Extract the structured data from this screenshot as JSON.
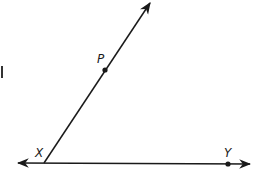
{
  "diagram": {
    "type": "geometry-angle",
    "colors": {
      "stroke": "#1a1a1a",
      "background": "#ffffff"
    },
    "points": [
      {
        "id": "X",
        "label": "X",
        "x": 44,
        "y": 163,
        "dot": false
      },
      {
        "id": "P",
        "label": "P",
        "x": 105,
        "y": 70,
        "dot": true
      },
      {
        "id": "Y",
        "label": "Y",
        "x": 228,
        "y": 164,
        "dot": true
      }
    ],
    "lines": [
      {
        "id": "line-XY",
        "kind": "line",
        "from": [
          18,
          163
        ],
        "to": [
          250,
          164
        ],
        "arrows": "both"
      },
      {
        "id": "ray-XP",
        "kind": "ray",
        "from": [
          44,
          163
        ],
        "to": [
          150,
          3
        ],
        "arrows": "end"
      }
    ],
    "labels": {
      "x": "X",
      "p": "P",
      "y": "Y"
    }
  }
}
